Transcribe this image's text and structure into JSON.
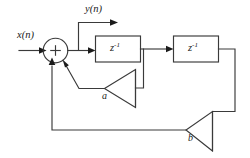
{
  "diagram": {
    "canvas": {
      "width": 250,
      "height": 158,
      "background": "#ffffff"
    },
    "stroke_color": "#3a3a3a",
    "text_color": "#1b1b1b",
    "labels": {
      "input_signal": "x(n)",
      "input_signal_base": "x",
      "input_signal_arg": "(n)",
      "output_signal": "y(n)",
      "output_signal_base": "y",
      "output_signal_arg": "(n)",
      "delay_1": "z",
      "delay_1_exponent": "-1",
      "delay_2": "z",
      "delay_2_exponent": "-1",
      "gain_a": "a",
      "gain_b": "b",
      "summing_operator": "+"
    },
    "nodes": [
      {
        "name": "input-port",
        "type": "signal-source",
        "label": "x(n)"
      },
      {
        "name": "summing-junction",
        "type": "adder",
        "label": "+",
        "inputs": 3
      },
      {
        "name": "output-port",
        "type": "signal-sink",
        "label": "y(n)"
      },
      {
        "name": "delay-block-1",
        "type": "unit-delay",
        "label": "z-1"
      },
      {
        "name": "delay-block-2",
        "type": "unit-delay",
        "label": "z-1"
      },
      {
        "name": "gain-triangle-a",
        "type": "amplifier",
        "label": "a"
      },
      {
        "name": "gain-triangle-b",
        "type": "amplifier",
        "label": "b"
      }
    ],
    "edges": [
      {
        "from": "input-port",
        "to": "summing-junction"
      },
      {
        "from": "summing-junction",
        "to": "output-port"
      },
      {
        "from": "summing-junction",
        "to": "delay-block-1"
      },
      {
        "from": "delay-block-1",
        "to": "delay-block-2"
      },
      {
        "from": "delay-block-1",
        "to": "gain-triangle-a"
      },
      {
        "from": "gain-triangle-a",
        "to": "summing-junction"
      },
      {
        "from": "delay-block-2",
        "to": "gain-triangle-b"
      },
      {
        "from": "gain-triangle-b",
        "to": "summing-junction"
      }
    ]
  }
}
